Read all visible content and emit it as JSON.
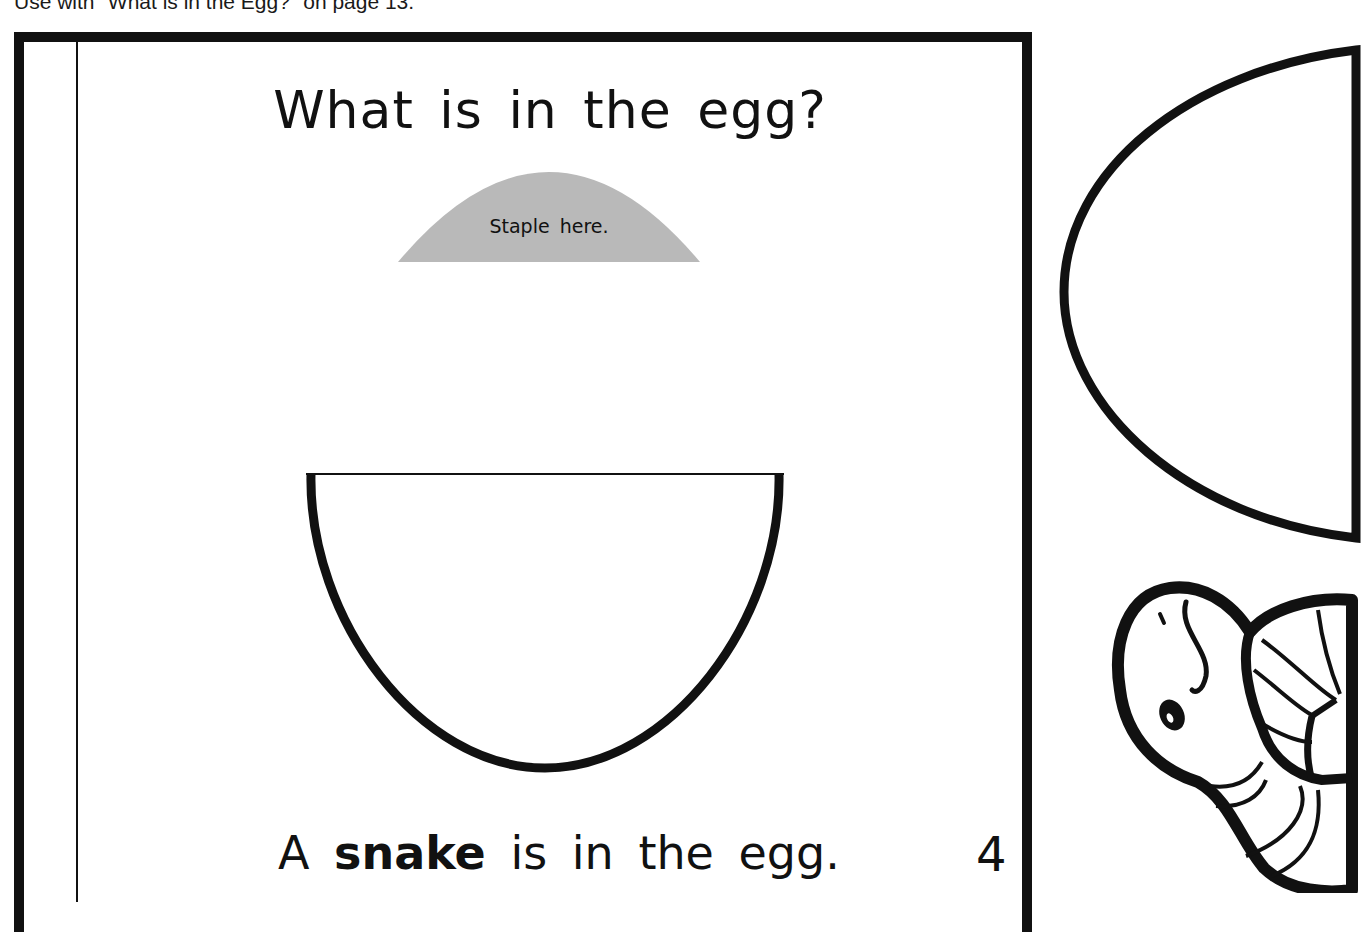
{
  "caption": "Use with \"What is in the Egg?\" on page 13.",
  "page": {
    "title": "What is in the egg?",
    "staple_label": "Staple here.",
    "sentence": {
      "prefix": "A",
      "bold_word": "snake",
      "suffix": "is in the egg."
    },
    "page_number": "4"
  },
  "cutouts": {
    "egg_top_half": "egg-top-cutout",
    "snake_picture": "snake-cutout"
  },
  "colors": {
    "ink": "#111111",
    "staple_fill": "#b9b9b9",
    "paper": "#ffffff"
  }
}
